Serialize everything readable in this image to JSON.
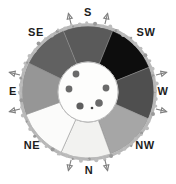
{
  "figure": {
    "title": "",
    "type": "compass-rose-sector-diagram",
    "background_color": "#ffffff",
    "outline_color": "#6f6f6f",
    "center": {
      "cx": 88,
      "cy": 92
    },
    "ring": {
      "inner_radius": 30,
      "outer_radius": 66,
      "rim_color": "#b7b7b7",
      "rim_width": 3
    }
  },
  "labels": [
    {
      "id": "label-s",
      "text": "S",
      "x": 88,
      "y": 16,
      "anchor": "middle"
    },
    {
      "id": "label-sw",
      "text": "SW",
      "x": 146,
      "y": 36,
      "anchor": "middle"
    },
    {
      "id": "label-w",
      "text": "W",
      "x": 163,
      "y": 95,
      "anchor": "middle"
    },
    {
      "id": "label-nw",
      "text": "NW",
      "x": 145,
      "y": 149,
      "anchor": "middle"
    },
    {
      "id": "label-n",
      "text": "N",
      "x": 89,
      "y": 174,
      "anchor": "middle"
    },
    {
      "id": "label-ne",
      "text": "NE",
      "x": 32,
      "y": 149,
      "anchor": "middle"
    },
    {
      "id": "label-e",
      "text": "E",
      "x": 13,
      "y": 95,
      "anchor": "middle"
    },
    {
      "id": "label-se",
      "text": "SE",
      "x": 36,
      "y": 36,
      "anchor": "middle"
    }
  ],
  "sectors": [
    {
      "id": "sector-s",
      "direction": "S",
      "start_deg": -112,
      "end_deg": -68,
      "fill": "#5a5a5a"
    },
    {
      "id": "sector-sw",
      "direction": "SW",
      "start_deg": -68,
      "end_deg": -22,
      "fill": "#0d0d0d"
    },
    {
      "id": "sector-w",
      "direction": "W",
      "start_deg": -22,
      "end_deg": 24,
      "fill": "#4f4f4f"
    },
    {
      "id": "sector-nw",
      "direction": "NW",
      "start_deg": 24,
      "end_deg": 70,
      "fill": "#a6a6a6"
    },
    {
      "id": "sector-n",
      "direction": "N",
      "start_deg": 70,
      "end_deg": 114,
      "fill": "#f2f2f0"
    },
    {
      "id": "sector-ne",
      "direction": "NE",
      "start_deg": 114,
      "end_deg": 160,
      "fill": "#fbfbfa"
    },
    {
      "id": "sector-e",
      "direction": "E",
      "start_deg": 160,
      "end_deg": 206,
      "fill": "#969696"
    },
    {
      "id": "sector-se",
      "direction": "SE",
      "start_deg": 206,
      "end_deg": 248,
      "fill": "#616161"
    }
  ],
  "center_disk": {
    "id": "center-disk",
    "radius": 30,
    "fill": "#fdfdfc",
    "stroke": "#bdbdbd",
    "dots": [
      {
        "id": "center-dot-1",
        "cx": 76,
        "cy": 74,
        "r": 3.4,
        "fill": "#6a6a6a"
      },
      {
        "id": "center-dot-2",
        "cx": 69,
        "cy": 89,
        "r": 3.4,
        "fill": "#6a6a6a"
      },
      {
        "id": "center-dot-3",
        "cx": 80,
        "cy": 106,
        "r": 3.6,
        "fill": "#5e5e5e"
      },
      {
        "id": "center-dot-4",
        "cx": 99,
        "cy": 103,
        "r": 3.8,
        "fill": "#6a6a6a"
      },
      {
        "id": "center-dot-5",
        "cx": 106,
        "cy": 88,
        "r": 3.4,
        "fill": "#6a6a6a"
      },
      {
        "id": "center-dot-6",
        "cx": 92,
        "cy": 108,
        "r": 1.3,
        "fill": "#444444"
      }
    ]
  },
  "arrows": [
    {
      "id": "arrow-s-left",
      "angle_deg": -104,
      "label": "S",
      "color": "#808080"
    },
    {
      "id": "arrow-s-right",
      "angle_deg": -76,
      "label": "S",
      "color": "#808080"
    },
    {
      "id": "arrow-w-upper",
      "angle_deg": -14,
      "label": "W",
      "color": "#808080"
    },
    {
      "id": "arrow-w-lower",
      "angle_deg": 14,
      "label": "W",
      "color": "#808080"
    },
    {
      "id": "arrow-n-left",
      "angle_deg": 76,
      "label": "N",
      "color": "#808080"
    },
    {
      "id": "arrow-n-right",
      "angle_deg": 104,
      "label": "N",
      "color": "#808080"
    },
    {
      "id": "arrow-e-lower",
      "angle_deg": 166,
      "label": "E",
      "color": "#808080"
    },
    {
      "id": "arrow-e-upper",
      "angle_deg": 194,
      "label": "E",
      "color": "#808080"
    }
  ]
}
